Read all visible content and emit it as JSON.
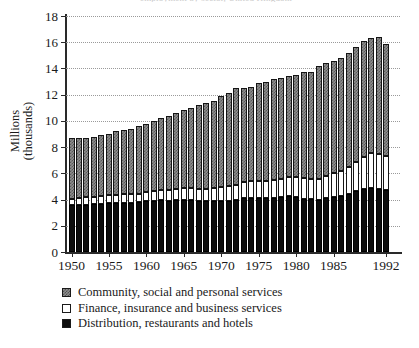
{
  "figure": {
    "title_remnant": "employment by sector, United Kingdom",
    "ylabel_line1": "Millions",
    "ylabel_line2": "(thousands)"
  },
  "legend": {
    "position": "below-plot",
    "items": [
      {
        "key": "community",
        "label": "Community, social and personal services",
        "swatch": "gray-checkered-swatch",
        "color": "#8e8e8e"
      },
      {
        "key": "finance",
        "label": "Finance, insurance and business services",
        "swatch": "white-swatch",
        "color": "#ffffff"
      },
      {
        "key": "distribution",
        "label": "Distribution, restaurants and hotels",
        "swatch": "black-swatch",
        "color": "#0d0d0d"
      }
    ]
  },
  "chart_data": {
    "type": "bar",
    "stacked": true,
    "title": "",
    "xlabel": "",
    "ylabel": "Millions (thousands)",
    "ylim": [
      0,
      18
    ],
    "yticks": [
      0,
      2,
      4,
      6,
      8,
      10,
      12,
      14,
      16,
      18
    ],
    "grid": true,
    "categories": [
      "1950",
      "1951",
      "1952",
      "1953",
      "1954",
      "1955",
      "1956",
      "1957",
      "1958",
      "1959",
      "1960",
      "1961",
      "1962",
      "1963",
      "1964",
      "1965",
      "1966",
      "1967",
      "1968",
      "1969",
      "1970",
      "1971",
      "1972",
      "1973",
      "1974",
      "1975",
      "1976",
      "1977",
      "1978",
      "1979",
      "1980",
      "1981",
      "1982",
      "1983",
      "1984",
      "1985",
      "1986",
      "1987",
      "1988",
      "1989",
      "1990",
      "1991",
      "1992"
    ],
    "xtick_labels": [
      "1950",
      "1955",
      "1960",
      "1965",
      "1970",
      "1975",
      "1980",
      "1985",
      "1992"
    ],
    "xtick_categories": [
      "1950",
      "1955",
      "1960",
      "1965",
      "1970",
      "1975",
      "1980",
      "1985",
      "1992"
    ],
    "series": [
      {
        "name": "Distribution, restaurants and hotels",
        "color": "#0d0d0d",
        "values": [
          3.55,
          3.6,
          3.62,
          3.64,
          3.68,
          3.72,
          3.74,
          3.76,
          3.74,
          3.78,
          3.86,
          3.92,
          3.94,
          3.92,
          3.96,
          3.98,
          3.96,
          3.88,
          3.86,
          3.88,
          3.92,
          3.9,
          3.96,
          4.1,
          4.14,
          4.12,
          4.1,
          4.14,
          4.2,
          4.28,
          4.22,
          4.08,
          4.02,
          4.0,
          4.1,
          4.2,
          4.28,
          4.44,
          4.62,
          4.8,
          4.9,
          4.84,
          4.76
        ]
      },
      {
        "name": "Finance, insurance and business services",
        "color": "#ffffff",
        "values": [
          0.52,
          0.54,
          0.55,
          0.56,
          0.58,
          0.6,
          0.62,
          0.64,
          0.66,
          0.68,
          0.72,
          0.76,
          0.8,
          0.82,
          0.86,
          0.9,
          0.94,
          0.96,
          0.98,
          1.02,
          1.06,
          1.1,
          1.16,
          1.24,
          1.28,
          1.3,
          1.32,
          1.34,
          1.4,
          1.46,
          1.52,
          1.54,
          1.56,
          1.6,
          1.7,
          1.8,
          1.92,
          2.08,
          2.28,
          2.48,
          2.62,
          2.6,
          2.58
        ]
      },
      {
        "name": "Community, social and personal services",
        "color": "#8e8e8e",
        "values": [
          4.63,
          4.56,
          4.53,
          4.6,
          4.64,
          4.68,
          4.84,
          4.9,
          5.0,
          5.14,
          5.22,
          5.32,
          5.46,
          5.66,
          5.78,
          5.92,
          6.1,
          6.36,
          6.56,
          6.6,
          6.92,
          7.1,
          7.38,
          7.16,
          7.18,
          7.48,
          7.58,
          7.72,
          7.7,
          7.66,
          7.76,
          8.08,
          8.12,
          8.6,
          8.62,
          8.6,
          8.6,
          8.68,
          8.7,
          8.82,
          8.78,
          8.96,
          8.56
        ]
      }
    ],
    "totals": [
      8.7,
      8.7,
      8.7,
      8.8,
      8.9,
      9.0,
      9.2,
      9.3,
      9.4,
      9.6,
      9.8,
      10.0,
      10.2,
      10.4,
      10.6,
      10.8,
      11.0,
      11.2,
      11.4,
      11.5,
      11.9,
      12.1,
      12.5,
      12.5,
      12.6,
      12.9,
      13.0,
      13.2,
      13.3,
      13.4,
      13.5,
      13.7,
      13.7,
      14.2,
      14.42,
      14.6,
      14.8,
      15.2,
      15.6,
      16.1,
      16.3,
      16.4,
      15.9
    ]
  }
}
